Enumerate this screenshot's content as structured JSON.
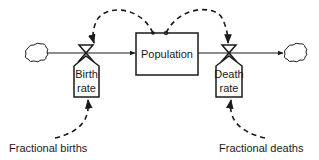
{
  "diagram": {
    "type": "stock-and-flow",
    "stock": {
      "label": "Population"
    },
    "inflow": {
      "valve_label_line1": "Birth",
      "valve_label_line2": "rate"
    },
    "outflow": {
      "valve_label_line1": "Death",
      "valve_label_line2": "rate"
    },
    "auxiliaries": {
      "births": "Fractional births",
      "deaths": "Fractional deaths"
    },
    "sources_sinks": [
      "cloud-source",
      "cloud-sink"
    ],
    "colors": {
      "stroke": "#1a1a1a",
      "background": "#ffffff"
    }
  }
}
